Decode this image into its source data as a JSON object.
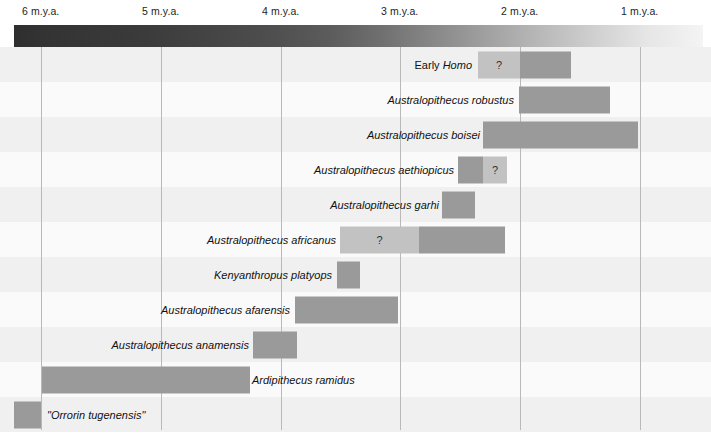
{
  "chart_data": {
    "type": "bar",
    "title": "",
    "subtitle": "",
    "xlabel": "",
    "ylabel": "",
    "orientation": "horizontal",
    "axis": {
      "unit": "m.y.a.",
      "direction": "right-to-left (older on left)",
      "xlim": [
        6.2,
        0.47
      ],
      "ticks": [
        {
          "value": 6,
          "label": "6 m.y.a.",
          "x": 41
        },
        {
          "value": 5,
          "label": "5 m.y.a.",
          "x": 161
        },
        {
          "value": 4,
          "label": "4 m.y.a.",
          "x": 281
        },
        {
          "value": 3,
          "label": "3 m.y.a.",
          "x": 400
        },
        {
          "value": 2,
          "label": "2 m.y.a.",
          "x": 520
        },
        {
          "value": 1,
          "label": "1 m.y.a.",
          "x": 640
        }
      ],
      "grid": true,
      "legend": "none"
    },
    "colors": {
      "bar_certain": "#9a9a9a",
      "bar_uncertain": "#c2c2c2",
      "band_oldest": "#2e2e2e",
      "band_youngest": "#f4f4f4",
      "row_band": "#f0f0f0",
      "row_band_alt": "#fafafa",
      "gridline": "#b9b9b9"
    },
    "uncertain_marker": "?",
    "categories": [
      "Early Homo",
      "Australopithecus robustus",
      "Australopithecus boisei",
      "Australopithecus aethiopicus",
      "Australopithecus garhi",
      "Australopithecus africanus",
      "Kenyanthropus platyops",
      "Australopithecus afarensis",
      "Australopithecus anamensis",
      "Ardipithecus ramidus",
      "\"Orrorin tugenensis\""
    ],
    "rows": [
      {
        "label_roman": "Early ",
        "label_italic": "Homo",
        "label_full": "Early Homo",
        "label_style": "mixed",
        "label_x": 398,
        "label_width": 74,
        "row_top": 0,
        "segments": [
          {
            "kind": "uncertain",
            "marker": "?",
            "x": 478,
            "width": 42,
            "from_mya": 2.32,
            "to_mya": 2.0
          },
          {
            "kind": "certain",
            "marker": "",
            "x": 520,
            "width": 51,
            "from_mya": 2.0,
            "to_mya": 1.58
          }
        ]
      },
      {
        "label_roman": "",
        "label_italic": "Australopithecus robustus",
        "label_full": "Australopithecus robustus",
        "label_style": "italic",
        "label_x": 370,
        "label_width": 144,
        "row_top": 35,
        "segments": [
          {
            "kind": "certain",
            "marker": "",
            "x": 519,
            "width": 91,
            "from_mya": 2.0,
            "to_mya": 1.24
          }
        ]
      },
      {
        "label_roman": "",
        "label_italic": "Australopithecus boisei",
        "label_full": "Australopithecus boisei",
        "label_style": "italic",
        "label_x": 352,
        "label_width": 128,
        "row_top": 70,
        "segments": [
          {
            "kind": "certain",
            "marker": "",
            "x": 483,
            "width": 155,
            "from_mya": 2.31,
            "to_mya": 1.02
          }
        ]
      },
      {
        "label_roman": "",
        "label_italic": "Australopithecus aethiopicus",
        "label_full": "Australopithecus aethiopicus",
        "label_style": "italic",
        "label_x": 298,
        "label_width": 156,
        "row_top": 105,
        "segments": [
          {
            "kind": "certain",
            "marker": "",
            "x": 458,
            "width": 25,
            "from_mya": 2.52,
            "to_mya": 2.31
          },
          {
            "kind": "uncertain",
            "marker": "?",
            "x": 483,
            "width": 24,
            "from_mya": 2.31,
            "to_mya": 2.11
          }
        ]
      },
      {
        "label_roman": "",
        "label_italic": "Australopithecus garhi",
        "label_full": "Australopithecus garhi",
        "label_style": "italic",
        "label_x": 317,
        "label_width": 122,
        "row_top": 140,
        "segments": [
          {
            "kind": "certain",
            "marker": "",
            "x": 442,
            "width": 33,
            "from_mya": 2.65,
            "to_mya": 2.38
          }
        ]
      },
      {
        "label_roman": "",
        "label_italic": "Australopithecus africanus",
        "label_full": "Australopithecus africanus",
        "label_style": "italic",
        "label_x": 190,
        "label_width": 146,
        "row_top": 175,
        "segments": [
          {
            "kind": "uncertain",
            "marker": "?",
            "x": 340,
            "width": 79,
            "from_mya": 3.5,
            "to_mya": 2.84
          },
          {
            "kind": "certain",
            "marker": "",
            "x": 419,
            "width": 86,
            "from_mya": 2.84,
            "to_mya": 2.12
          }
        ]
      },
      {
        "label_roman": "",
        "label_italic": "Kenyanthropus platyops",
        "label_full": "Kenyanthropus platyops",
        "label_style": "italic",
        "label_x": 202,
        "label_width": 130,
        "row_top": 210,
        "segments": [
          {
            "kind": "certain",
            "marker": "",
            "x": 337,
            "width": 23,
            "from_mya": 3.52,
            "to_mya": 3.33
          }
        ]
      },
      {
        "label_roman": "",
        "label_italic": "Australopithecus afarensis",
        "label_full": "Australopithecus afarensis",
        "label_style": "italic",
        "label_x": 148,
        "label_width": 142,
        "row_top": 245,
        "segments": [
          {
            "kind": "certain",
            "marker": "",
            "x": 295,
            "width": 103,
            "from_mya": 3.87,
            "to_mya": 3.01
          }
        ]
      },
      {
        "label_roman": "",
        "label_italic": "Australopithecus anamensis",
        "label_full": "Australopithecus anamensis",
        "label_style": "italic",
        "label_x": 101,
        "label_width": 148,
        "row_top": 280,
        "segments": [
          {
            "kind": "certain",
            "marker": "",
            "x": 253,
            "width": 44,
            "from_mya": 4.22,
            "to_mya": 3.86
          }
        ]
      },
      {
        "label_roman": "",
        "label_italic": "Ardipithecus ramidus",
        "label_full": "Ardipithecus ramidus",
        "label_style": "italic",
        "label_x": 252,
        "label_width": 116,
        "label_align": "left",
        "row_top": 315,
        "segments": [
          {
            "kind": "certain",
            "marker": "",
            "x": 42,
            "width": 208,
            "from_mya": 5.99,
            "to_mya": 4.25
          }
        ]
      },
      {
        "label_roman": "",
        "label_italic": "\"Orrorin tugenensis\"",
        "label_full": "\"Orrorin tugenensis\"",
        "label_style": "italic",
        "label_x": 47,
        "label_width": 116,
        "label_align": "left",
        "row_top": 350,
        "segments": [
          {
            "kind": "certain",
            "marker": "",
            "x": 14,
            "width": 27,
            "from_mya": 6.22,
            "to_mya": 6.0
          }
        ]
      }
    ]
  }
}
